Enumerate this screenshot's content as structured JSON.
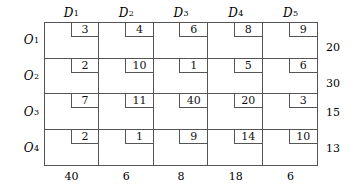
{
  "table": {
    "type": "transportation-tableau",
    "column_headers": [
      "D",
      "D",
      "D",
      "D",
      "D"
    ],
    "column_header_subscripts": [
      "1",
      "2",
      "3",
      "4",
      "5"
    ],
    "row_headers": [
      "O",
      "O",
      "O",
      "O"
    ],
    "row_header_subscripts": [
      "1",
      "2",
      "3",
      "4"
    ],
    "costs": [
      [
        "3",
        "4",
        "6",
        "8",
        "9"
      ],
      [
        "2",
        "10",
        "1",
        "5",
        "6"
      ],
      [
        "7",
        "11",
        "40",
        "20",
        "3"
      ],
      [
        "2",
        "1",
        "9",
        "14",
        "10"
      ]
    ],
    "supplies": [
      "20",
      "30",
      "15",
      "13"
    ],
    "demands": [
      "40",
      "6",
      "8",
      "18",
      "6"
    ]
  },
  "chart_data": {
    "type": "table",
    "title": "",
    "categories": [
      "D1",
      "D2",
      "D3",
      "D4",
      "D5"
    ],
    "series": [
      {
        "name": "O1",
        "values": [
          3,
          4,
          6,
          8,
          9
        ]
      },
      {
        "name": "O2",
        "values": [
          2,
          10,
          1,
          5,
          6
        ]
      },
      {
        "name": "O3",
        "values": [
          7,
          11,
          40,
          20,
          3
        ]
      },
      {
        "name": "O4",
        "values": [
          2,
          1,
          9,
          14,
          10
        ]
      }
    ],
    "supplies": [
      20,
      30,
      15,
      13
    ],
    "demands": [
      40,
      6,
      8,
      18,
      6
    ],
    "xlabel": "",
    "ylabel": ""
  },
  "colors": {
    "line": "#555555",
    "text": "#000000",
    "background": "#ffffff"
  }
}
